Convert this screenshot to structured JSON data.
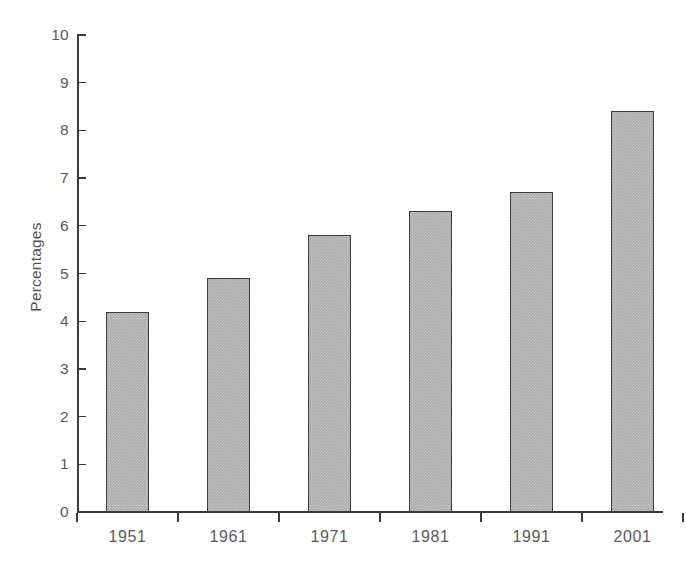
{
  "chart_data": {
    "type": "bar",
    "title": "",
    "subtitle": "",
    "xlabel": "",
    "ylabel": "Percentages",
    "categories": [
      "1951",
      "1961",
      "1971",
      "1981",
      "1991",
      "2001"
    ],
    "values": [
      4.2,
      4.9,
      5.8,
      6.3,
      6.7,
      8.4
    ],
    "series": [
      {
        "name": "Percentages",
        "values": [
          4.2,
          4.9,
          5.8,
          6.3,
          6.7,
          8.4
        ]
      }
    ],
    "ylim": [
      0,
      10
    ],
    "y_ticks": [
      "0",
      "1",
      "2",
      "3",
      "4",
      "5",
      "6",
      "7",
      "8",
      "9",
      "10"
    ],
    "y_tick_values": [
      0,
      1,
      2,
      3,
      4,
      5,
      6,
      7,
      8,
      9,
      10
    ],
    "grid": false,
    "legend": false,
    "legend_position": "none",
    "bar_fill_color": "#ababab",
    "bar_border_color": "#3c3c3c",
    "axis_color": "#3b3b3b",
    "text_color": "#5a5a5a",
    "background_color": "#ffffff"
  }
}
